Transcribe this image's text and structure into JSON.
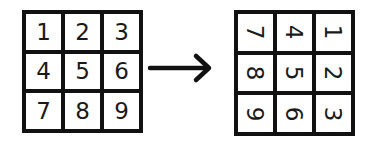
{
  "diagram": {
    "left_grid": {
      "cells": [
        "1",
        "2",
        "3",
        "4",
        "5",
        "6",
        "7",
        "8",
        "9"
      ]
    },
    "arrow": {
      "direction": "right"
    },
    "right_grid": {
      "rotation_degrees": 90,
      "cells": [
        "7",
        "4",
        "1",
        "8",
        "5",
        "2",
        "9",
        "6",
        "3"
      ]
    },
    "colors": {
      "line": "#111111",
      "background": "#ffffff",
      "text": "#1a1a1a"
    }
  }
}
